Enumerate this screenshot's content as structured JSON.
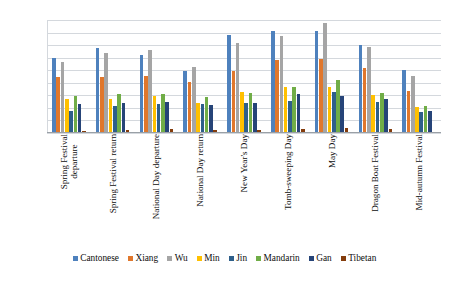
{
  "chart_data": {
    "type": "bar",
    "title": "",
    "subtitle": "",
    "xlabel": "",
    "ylabel": "",
    "ylim": [
      0,
      450000
    ],
    "ytick_step": 50000,
    "yticks": [
      "450000",
      "400000",
      "350000",
      "300000",
      "250000",
      "200000",
      "150000",
      "100000",
      "50000",
      "0"
    ],
    "grid": true,
    "legend_position": "bottom",
    "orientation": "vertical-grouped",
    "xtick_rotation": 90,
    "categories": [
      "Spring Festival departure",
      "Spring Festival return",
      "National Day departure",
      "National Day return",
      "New Year's Day",
      "Tomb-sweeping Day",
      "May Day",
      "Dragon Boat Festival",
      "Mid-autumn Festival"
    ],
    "category_lines": [
      [
        "Spring Festival",
        "departure"
      ],
      [
        "Spring Festival return",
        ""
      ],
      [
        "National Day departure",
        ""
      ],
      [
        "National Day return",
        ""
      ],
      [
        "New Year's Day",
        ""
      ],
      [
        "Tomb-sweeping Day",
        ""
      ],
      [
        "May Day",
        ""
      ],
      [
        "Dragon Boat Festival",
        ""
      ],
      [
        "Mid-autumn Festival",
        ""
      ]
    ],
    "series": [
      {
        "name": "Cantonese",
        "color": "#4E81BD",
        "values": [
          299000,
          337000,
          310000,
          247000,
          390000,
          408000,
          406000,
          351000,
          251000
        ]
      },
      {
        "name": "Xiang",
        "color": "#E0772C",
        "values": [
          222000,
          224000,
          228000,
          205000,
          246000,
          291000,
          295000,
          258000,
          169000
        ]
      },
      {
        "name": "Wu",
        "color": "#A5A5A5",
        "values": [
          283000,
          318000,
          329000,
          264000,
          359000,
          385000,
          440000,
          341000,
          228000
        ]
      },
      {
        "name": "Min",
        "color": "#FFC000",
        "values": [
          135000,
          135000,
          146000,
          120000,
          163000,
          184000,
          185000,
          152000,
          104000
        ]
      },
      {
        "name": "Jin",
        "color": "#2E5F8A",
        "values": [
          88000,
          107000,
          117000,
          117000,
          121000,
          129000,
          164000,
          122000,
          85000
        ]
      },
      {
        "name": "Mandarin",
        "color": "#70AD47",
        "values": [
          147000,
          155000,
          154000,
          145000,
          158000,
          184000,
          212000,
          158000,
          107000
        ]
      },
      {
        "name": "Gan",
        "color": "#264478",
        "values": [
          116000,
          119000,
          124000,
          112000,
          121000,
          155000,
          146000,
          134000,
          86000
        ]
      },
      {
        "name": "Tibetan",
        "color": "#843C0C",
        "values": [
          8000,
          11000,
          16000,
          11000,
          12000,
          17000,
          19000,
          17000,
          6000
        ]
      }
    ]
  },
  "legend": {
    "items": [
      {
        "label": "Cantonese",
        "color": "#4E81BD"
      },
      {
        "label": "Xiang",
        "color": "#E0772C"
      },
      {
        "label": "Wu",
        "color": "#A5A5A5"
      },
      {
        "label": "Min",
        "color": "#FFC000"
      },
      {
        "label": "Jin",
        "color": "#2E5F8A"
      },
      {
        "label": "Mandarin",
        "color": "#70AD47"
      },
      {
        "label": "Gan",
        "color": "#264478"
      },
      {
        "label": "Tibetan",
        "color": "#843C0C"
      }
    ]
  },
  "colors": {
    "gridline": "#d4d8dd",
    "axis": "#9aa0a6",
    "background": "#ffffff",
    "text": "#0d0d0d"
  }
}
